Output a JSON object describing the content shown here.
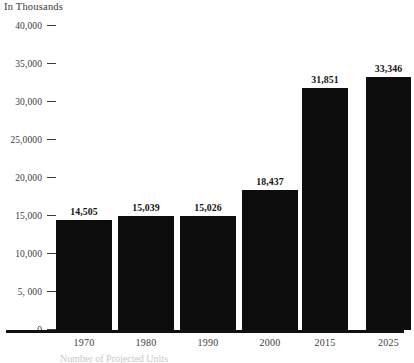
{
  "chart_data": {
    "type": "bar",
    "title": "",
    "unit_label": "In Thousands",
    "xlabel": "",
    "ylabel": "",
    "categories": [
      "1970",
      "1980",
      "1990",
      "2000",
      "2015",
      "2025"
    ],
    "values": [
      14505,
      15039,
      15026,
      18437,
      31851,
      33346
    ],
    "value_labels": [
      "14,505",
      "15,039",
      "15,026",
      "18,437",
      "31,851",
      "33,346"
    ],
    "ylim": [
      0,
      40000
    ],
    "ytick_values": [
      40000,
      35000,
      30000,
      25000,
      20000,
      15000,
      10000,
      5000,
      0
    ],
    "ytick_labels": [
      "40,000",
      "35,000",
      "30,000",
      "25,0000",
      "20,000",
      "15,000",
      "10,000",
      "5, 000",
      "0"
    ],
    "grid": false,
    "legend": "none",
    "bar_color": "#0d0d0d",
    "axis_color": "#111111",
    "text_color": "#3c3c3c"
  },
  "bottom_caption": "Number of Projected Units"
}
